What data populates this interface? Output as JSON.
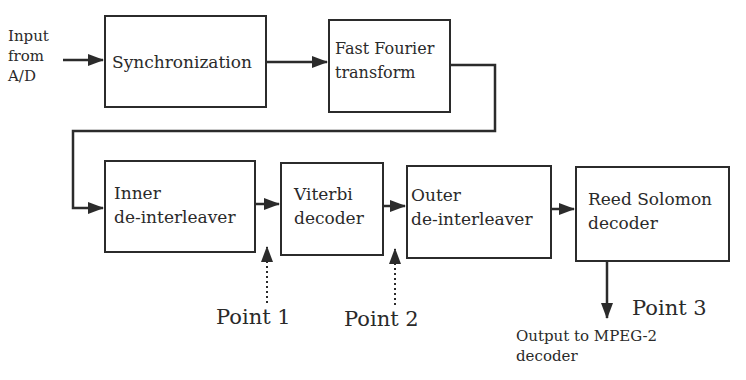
{
  "diagram": {
    "input_label": "Input\nfrom\nA/D",
    "blocks": [
      {
        "id": "sync",
        "label": "Synchronization"
      },
      {
        "id": "fft",
        "label": "Fast Fourier\ntransform"
      },
      {
        "id": "inner",
        "label": "Inner\nde-interleaver"
      },
      {
        "id": "viterbi",
        "label": "Viterbi\ndecoder"
      },
      {
        "id": "outer",
        "label": "Outer\nde-interleaver"
      },
      {
        "id": "rs",
        "label": "Reed Solomon\ndecoder"
      }
    ],
    "points": [
      {
        "label": "Point 1"
      },
      {
        "label": "Point 2"
      },
      {
        "label": "Point 3"
      }
    ],
    "output_label": "Output to MPEG-2\ndecoder",
    "connections": [
      [
        "input",
        "sync"
      ],
      [
        "sync",
        "fft"
      ],
      [
        "fft",
        "inner"
      ],
      [
        "inner",
        "viterbi"
      ],
      [
        "viterbi",
        "outer"
      ],
      [
        "outer",
        "rs"
      ],
      [
        "rs",
        "output"
      ]
    ],
    "colors": {
      "line": "#2b2b2b",
      "background": "#ffffff"
    }
  }
}
